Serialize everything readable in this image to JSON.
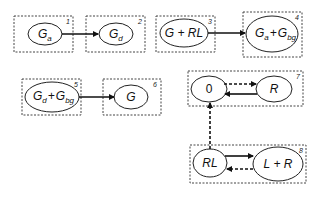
{
  "diagram": {
    "boxes": [
      {
        "id": 1,
        "number": "1",
        "node": {
          "base": "G",
          "sub": "a"
        }
      },
      {
        "id": 2,
        "number": "2",
        "node": {
          "base": "G",
          "sub": "d"
        }
      },
      {
        "id": 3,
        "number": "3",
        "node": {
          "label": "G + RL"
        }
      },
      {
        "id": 4,
        "number": "4",
        "node": {
          "parts": [
            {
              "base": "G",
              "sub": "a"
            },
            {
              "op": "+"
            },
            {
              "base": "G",
              "sub": "bg"
            }
          ]
        }
      },
      {
        "id": 5,
        "number": "5",
        "node": {
          "parts": [
            {
              "base": "G",
              "sub": "d"
            },
            {
              "op": "+"
            },
            {
              "base": "G",
              "sub": "bg"
            }
          ]
        }
      },
      {
        "id": 6,
        "number": "6",
        "node": {
          "label": "G"
        }
      },
      {
        "id": 7,
        "number": "7",
        "nodes": [
          {
            "label": "0"
          },
          {
            "label": "R"
          }
        ]
      },
      {
        "id": 8,
        "number": "8",
        "nodes": [
          {
            "label": "RL"
          },
          {
            "label": "L + R"
          }
        ]
      }
    ],
    "labels": {
      "b1_base": "G",
      "b1_sub": "a",
      "b2_base": "G",
      "b2_sub": "d",
      "b3": "G + RL",
      "b4_g1": "G",
      "b4_s1": "a",
      "b4_op": "+",
      "b4_g2": "G",
      "b4_s2": "bg",
      "b5_g1": "G",
      "b5_s1": "d",
      "b5_op": "+",
      "b5_g2": "G",
      "b5_s2": "bg",
      "b6": "G",
      "b7_n1": "0",
      "b7_n2": "R",
      "b8_n1": "RL",
      "b8_n2": "L + R",
      "n1": "1",
      "n2": "2",
      "n3": "3",
      "n4": "4",
      "n5": "5",
      "n6": "6",
      "n7": "7",
      "n8": "8"
    },
    "edges": [
      {
        "from": "Ga",
        "to": "Gd",
        "style": "solid"
      },
      {
        "from": "G + RL",
        "to": "Ga + Gbg",
        "style": "solid"
      },
      {
        "from": "Gd + Gbg",
        "to": "G",
        "style": "solid"
      },
      {
        "from": "0",
        "to": "R",
        "style": "dashed"
      },
      {
        "from": "R",
        "to": "0",
        "style": "solid"
      },
      {
        "from": "RL",
        "to": "0",
        "style": "dashed"
      },
      {
        "from": "RL",
        "to": "L + R",
        "style": "solid"
      },
      {
        "from": "L + R",
        "to": "RL",
        "style": "dashed"
      }
    ]
  }
}
